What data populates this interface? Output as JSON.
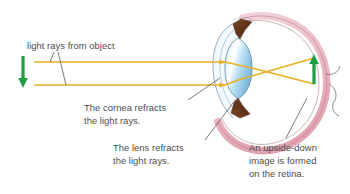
{
  "figure": {
    "background_color": "#ffffff",
    "width": 350,
    "height": 194
  },
  "palette": {
    "ray": "#e8b020",
    "ray_light": "#f0c84c",
    "object_arrow": "#1e9e40",
    "image_arrow": "#1e9e40",
    "sclera": "#e8b8c0",
    "sclera_edge": "#b5848f",
    "lens": "#a8d4ee",
    "lens_edge": "#5d8aa8",
    "iris": "#6b3a1e",
    "cornea_edge": "#8ba9c4",
    "leader_line": "#58585a",
    "text": "#4c4c4e"
  },
  "labels": {
    "light_rays": "light rays from object",
    "cornea": "The cornea refracts\nthe light rays.",
    "lens": "The lens refracts\nthe light rays.",
    "retina": "An upside-down\nimage is formed\non the retina."
  },
  "diagram_parts": {
    "object_arrow_name": "object-arrow",
    "image_arrow_name": "retina-image-arrow",
    "upper_ray_name": "upper-light-ray",
    "lower_ray_name": "lower-light-ray",
    "eyeball_name": "eyeball",
    "cornea_name": "cornea",
    "lens_name": "lens",
    "iris_top_name": "iris-upper",
    "iris_bottom_name": "iris-lower",
    "retina_name": "retina",
    "optic_nerve_name": "optic-nerve"
  }
}
